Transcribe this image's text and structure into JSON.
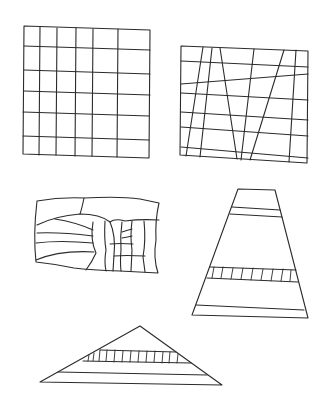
{
  "figure": {
    "background": "#ffffff",
    "ink_color": "#2b2b2b",
    "shapes": [
      {
        "id": "grid-square",
        "label": "regular grid square",
        "outline": [
          [
            24,
            26
          ],
          [
            150,
            30
          ],
          [
            149,
            158
          ],
          [
            23,
            154
          ]
        ],
        "vertical_x_top": [
          40,
          57,
          76,
          93,
          118
        ],
        "vertical_x_bottom": [
          39,
          56,
          75,
          92,
          117
        ],
        "horizontal_y_left": [
          47,
          71,
          91,
          112,
          136
        ],
        "horizontal_y_right": [
          50,
          74,
          94,
          116,
          140
        ]
      },
      {
        "id": "skewed-grid",
        "label": "grid with slanted lines",
        "outline": [
          [
            181,
            46
          ],
          [
            308,
            51
          ],
          [
            307,
            163
          ],
          [
            180,
            155
          ]
        ],
        "horizontals": [
          [
            [
              181,
              61
            ],
            [
              308,
              67
            ]
          ],
          [
            [
              181,
              84
            ],
            [
              308,
              74
            ]
          ],
          [
            [
              181,
              93
            ],
            [
              308,
              100
            ]
          ],
          [
            [
              181,
              112
            ],
            [
              308,
              120
            ]
          ],
          [
            [
              181,
              127
            ],
            [
              308,
              136
            ]
          ],
          [
            [
              181,
              147
            ],
            [
              308,
              158
            ]
          ]
        ],
        "slants": [
          [
            [
              203,
              47
            ],
            [
              186,
              156
            ]
          ],
          [
            [
              212,
              48
            ],
            [
              200,
              157
            ]
          ],
          [
            [
              220,
              48
            ],
            [
              237,
              159
            ]
          ],
          [
            [
              254,
              49
            ],
            [
              241,
              160
            ]
          ],
          [
            [
              284,
              50
            ],
            [
              250,
              160
            ]
          ],
          [
            [
              296,
              50
            ],
            [
              289,
              162
            ]
          ]
        ]
      },
      {
        "id": "irregular-blob",
        "label": "irregular wavy patchwork",
        "outline_path": "M37,201 Q60,197 84,198 Q120,196 140,199 L159,203 Q155,220 156,240 Q153,258 158,273 Q140,272 120,271 Q90,270 74,268 Q55,264 36,262 Q33,235 37,201 Z"
      },
      {
        "id": "trapezoid",
        "label": "tall trapezoid with hatched band",
        "outline": [
          [
            238,
            189
          ],
          [
            275,
            190
          ],
          [
            308,
            318
          ],
          [
            192,
            315
          ]
        ],
        "bands_y": [
          [
            208,
            211
          ],
          [
            214,
            217
          ],
          [
            277,
            282
          ],
          [
            291,
            295
          ],
          [
            304,
            308
          ]
        ],
        "hatch_count": 9
      },
      {
        "id": "triangle",
        "label": "wide triangle with hatched band",
        "outline": [
          [
            140,
            326
          ],
          [
            222,
            385
          ],
          [
            40,
            382
          ]
        ],
        "band_top_y": 350,
        "band_bottom_y": 363,
        "base_inner_y": 372,
        "hatch_count": 14
      }
    ]
  }
}
